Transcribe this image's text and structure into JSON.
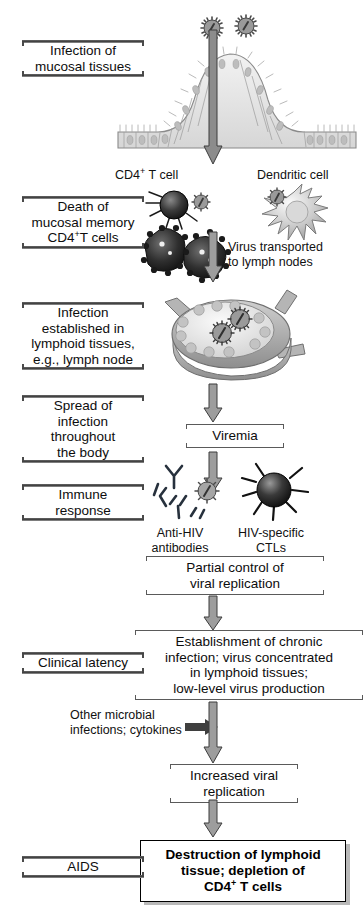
{
  "diagram": {
    "stages": [
      {
        "id": "mucosal-infection",
        "label": "Infection of\nmucosal tissues"
      },
      {
        "id": "memory-cd4-death",
        "label": "Death of\nmucosal memory\nCD4+ T cells"
      },
      {
        "id": "lymphoid-infection",
        "label": "Infection\nestablished in\nlymphoid tissues,\ne.g., lymph node"
      },
      {
        "id": "systemic-spread",
        "label": "Spread of\ninfection\nthroughout\nthe body"
      },
      {
        "id": "immune-response",
        "label": "Immune\nresponse"
      },
      {
        "id": "clinical-latency",
        "label": "Clinical latency"
      },
      {
        "id": "aids",
        "label": "AIDS"
      }
    ],
    "stage_lines": {
      "mucosal_infection": [
        "Infection of",
        "mucosal tissues"
      ],
      "memory_cd4_death": [
        "Death of",
        "mucosal memory",
        "CD4",
        "T cells"
      ],
      "lymphoid_infection": [
        "Infection",
        "established in",
        "lymphoid tissues,",
        "e.g., lymph node"
      ],
      "systemic_spread": [
        "Spread of",
        "infection",
        "throughout",
        "the body"
      ],
      "immune_response": [
        "Immune",
        "response"
      ],
      "clinical_latency": "Clinical latency",
      "aids": "AIDS"
    },
    "center_nodes": {
      "cd4_t_cell": "CD4",
      "cd4_t_cell_tail": " T cell",
      "dendritic_cell": "Dendritic cell",
      "virus_transport": [
        "Virus transported",
        "to lymph nodes"
      ],
      "viremia": "Viremia",
      "anti_hiv": [
        "Anti-HIV",
        "antibodies"
      ],
      "hiv_ctl": [
        "HIV-specific",
        "CTLs"
      ],
      "partial_control": [
        "Partial control of",
        "viral replication"
      ],
      "chronic": [
        "Establishment of chronic",
        "infection; virus concentrated",
        "in lymphoid tissues;",
        "low-level virus production"
      ],
      "other_microbial": [
        "Other microbial",
        "infections; cytokines"
      ],
      "increased_repl": [
        "Increased viral",
        "replication"
      ],
      "destruction": [
        "Destruction of lymphoid",
        "tissue; depletion of",
        "CD4",
        " T cells"
      ]
    },
    "superscripts": {
      "plus": "+"
    },
    "colors": {
      "rule_dark": "#3a3a3a",
      "rule_light": "#9a9a9a",
      "bracket": "#5a5a5a",
      "arrow_fill": "#9d9d9d",
      "arrow_edge": "#3d3d3d",
      "cell_dark": "#2b2b2b",
      "virus_grey": "#8f8f8f",
      "text": "#111111",
      "background": "#ffffff",
      "shadow": "#b9b9b9"
    },
    "graphics": [
      {
        "name": "hiv-virion-top-left",
        "type": "virion"
      },
      {
        "name": "hiv-virion-top-right",
        "type": "virion"
      },
      {
        "name": "mucosal-epithelium",
        "type": "epithelium"
      },
      {
        "name": "cd4-t-cell",
        "type": "cell"
      },
      {
        "name": "dendritic-cell",
        "type": "cell"
      },
      {
        "name": "dying-infected-cells",
        "type": "cell-cluster"
      },
      {
        "name": "lymph-node",
        "type": "organ"
      },
      {
        "name": "antibodies",
        "type": "antibody-cluster"
      },
      {
        "name": "ctl-cell",
        "type": "cell"
      }
    ]
  }
}
